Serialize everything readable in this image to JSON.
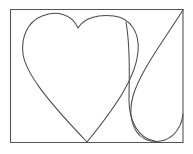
{
  "figure": {
    "title": "Hand-drawn heart and teardrop loop inside a rectangular frame",
    "background_color": "#ffffff",
    "stroke_color": "#4a4a4a",
    "frame_color": "#555555",
    "stroke_width": "1.05",
    "canvas_width": 193,
    "canvas_height": 154
  },
  "frame": {
    "label": "rectangle-border",
    "x": 10,
    "y": 9,
    "width": 173,
    "height": 134,
    "path": "M 10.5 9.5 L 183 9.5 L 183 142.5 L 10.5 142.5 Z"
  },
  "shapes": [
    {
      "name": "heart-outline",
      "label": "Heart",
      "kind": "closed-curve",
      "cleft_point": [
        78,
        28
      ],
      "bottom_point": [
        87,
        142
      ],
      "left_extreme": [
        22,
        46
      ],
      "right_extreme": [
        138,
        47
      ],
      "path": "M 78 28 C 72 14 56 10 42 16 C 27 22 21 38 23 54 C 26 73 45 98 87 142 C 118 104 136 76 138 52 C 140 32 130 18 114 16 C 98 14 84 18 78 28 Z"
    },
    {
      "name": "teardrop-loop",
      "label": "Teardrop loop",
      "kind": "open-curve",
      "start_point": [
        183,
        10
      ],
      "path": "M 183 10 C 160 46 140 72 133 96 C 127 118 134 138 151 141 C 168 144 181 132 183 114"
    },
    {
      "name": "loop-inner-edge",
      "label": "Loop inner edge",
      "kind": "open-curve",
      "start_point": [
        126,
        22
      ],
      "path": "M 126 22 C 131 50 129 78 129 100 C 129 120 138 139 155 141"
    }
  ]
}
